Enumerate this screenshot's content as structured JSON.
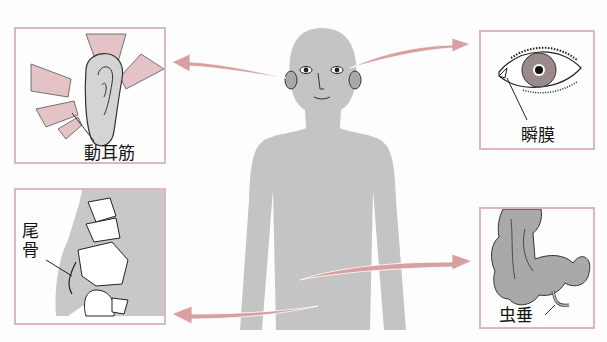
{
  "colors": {
    "arrow": "#d9a0a2",
    "panel_border": "#dcb8bc",
    "body_fill": "#c4c4c4",
    "organ_fill": "#b0b0b0",
    "background": "#fdfdfd"
  },
  "panels": [
    {
      "id": "ear",
      "label": "動耳筋",
      "position": "top-left",
      "icon": "ear-muscle-icon"
    },
    {
      "id": "eye",
      "label": "瞬膜",
      "position": "top-right",
      "icon": "eye-icon"
    },
    {
      "id": "coccyx",
      "label": "尾骨",
      "position": "bottom-left",
      "icon": "pelvis-bone-icon"
    },
    {
      "id": "appendix",
      "label": "虫垂",
      "position": "bottom-right",
      "icon": "intestine-appendix-icon"
    }
  ]
}
